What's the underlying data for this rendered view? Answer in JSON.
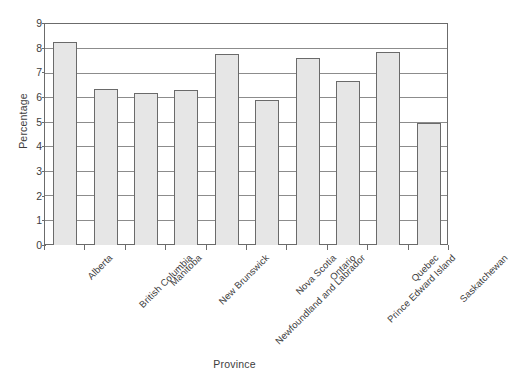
{
  "chart_data": {
    "type": "bar",
    "title": "",
    "xlabel": "Province",
    "ylabel": "Percentage",
    "ylim": [
      0,
      9
    ],
    "ytick_step": 1,
    "yticks": [
      "9",
      "8",
      "7",
      "6",
      "5",
      "4",
      "3",
      "2",
      "1",
      "0"
    ],
    "grid": "horizontal",
    "legend": "none",
    "categories": [
      "Alberta",
      "British Columbia",
      "Manitoba",
      "New Brunswick",
      "Newfoundland and Labrador",
      "Nova Scotia",
      "Ontario",
      "Prince Edward Island",
      "Quebec",
      "Saskatchewan"
    ],
    "values": [
      8.3,
      6.4,
      6.2,
      6.35,
      7.8,
      5.95,
      7.65,
      6.7,
      7.9,
      5.0
    ],
    "colors": {
      "bar_fill": "#e6e6e6",
      "bar_border": "#6a6a6a",
      "gridline": "#8c8c8c",
      "axis": "#6b6b6b",
      "text": "#3d3d3d",
      "background": "#ffffff"
    }
  }
}
